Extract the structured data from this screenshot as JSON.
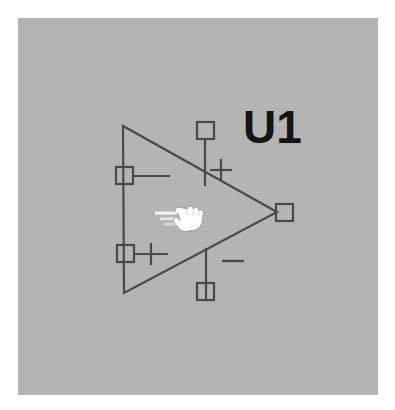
{
  "app": {
    "title": "Schematic Symbol Editor",
    "canvas_background": "#b6b6b6",
    "page_background": "#ffffff",
    "stroke_color": "#4a4a4a",
    "label_color": "#141414"
  },
  "symbol": {
    "name": "operational-amplifier",
    "designator": "U1",
    "body_shape": "triangle",
    "pins": [
      {
        "id": "pin-left-upper",
        "name": "left-upper-pin",
        "marker": "square-handle",
        "lead_direction": "right",
        "polarity": ""
      },
      {
        "id": "pin-left-lower",
        "name": "left-lower-pin",
        "marker": "square-handle",
        "lead_direction": "right",
        "polarity": "+"
      },
      {
        "id": "pin-top",
        "name": "top-supply-pin",
        "marker": "square-handle",
        "lead_direction": "down",
        "polarity": "+"
      },
      {
        "id": "pin-bottom",
        "name": "bottom-supply-pin",
        "marker": "square-handle",
        "lead_direction": "up",
        "polarity": "−"
      },
      {
        "id": "pin-output",
        "name": "output-pin",
        "marker": "square-handle",
        "lead_direction": "right",
        "polarity": ""
      }
    ]
  },
  "cursor": {
    "type": "drag-hand-cursor",
    "icon": "pointing-hand-icon",
    "direction": "right",
    "motion_lines": 3
  }
}
